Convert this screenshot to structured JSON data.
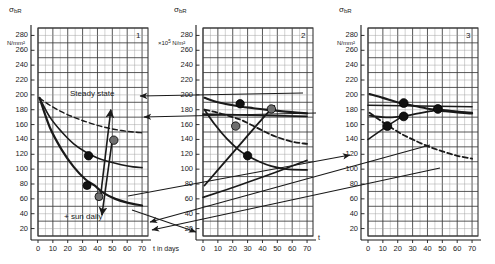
{
  "figure": {
    "background": "#ffffff",
    "ink_color": "#1a1a1a",
    "marker_dark": "#111111",
    "marker_grey": "#6e6e6e",
    "grid_major_color": "#3a3a3a",
    "grid_minor_color": "#9a9a9a"
  },
  "axes": {
    "y_label": "σ",
    "y_label_sub": "bR",
    "y_units_plain": "N/mm²",
    "y_units_scaled_prefix": "×10",
    "y_units_scaled_exp": "5",
    "y_units_scaled_suffix": " N/m²",
    "y_ticks": [
      "280",
      "260",
      "240",
      "220",
      "200",
      "180",
      "160",
      "140",
      "120",
      "100",
      "80",
      "60",
      "40",
      "20"
    ],
    "x_ticks": [
      "0",
      "10",
      "20",
      "30",
      "40",
      "50",
      "60",
      "70"
    ],
    "x_title_full": "t in days",
    "x_title_short": "t",
    "y_min": 10,
    "y_max": 290,
    "x_min": 0,
    "x_max": 74,
    "grid_minor_per_major_x": 2,
    "grid_minor_per_major_y": 2
  },
  "annotations": {
    "steady_state": "Steady state",
    "sun_daily": "+ sun daily"
  },
  "chart_data": {
    "type": "line",
    "xlabel": "t in days",
    "ylabel": "σbR in N/mm²",
    "xlim": [
      0,
      74
    ],
    "ylim": [
      10,
      290
    ],
    "grid": true,
    "legend": "none",
    "panels": [
      {
        "id": "1",
        "label": "1",
        "y_units": "N/mm²",
        "annotations": [
          "Steady state",
          "+ sun daily"
        ],
        "series": [
          {
            "name": "upper-dashed-decay",
            "style": "dashed",
            "width": 1.4,
            "points": [
              [
                1,
                196
              ],
              [
                8,
                186
              ],
              [
                16,
                177
              ],
              [
                24,
                170
              ],
              [
                32,
                164
              ],
              [
                40,
                159
              ],
              [
                48,
                155
              ],
              [
                56,
                152
              ],
              [
                64,
                150
              ],
              [
                70,
                149
              ]
            ]
          },
          {
            "name": "middle-solid-decay",
            "style": "solid",
            "width": 1.6,
            "points": [
              [
                1,
                196
              ],
              [
                8,
                170
              ],
              [
                16,
                150
              ],
              [
                24,
                134
              ],
              [
                32,
                123
              ],
              [
                40,
                115
              ],
              [
                48,
                110
              ],
              [
                56,
                106
              ],
              [
                64,
                103
              ],
              [
                70,
                102
              ]
            ]
          },
          {
            "name": "lower-solid-decay",
            "style": "solid",
            "width": 2.2,
            "points": [
              [
                1,
                196
              ],
              [
                8,
                156
              ],
              [
                16,
                126
              ],
              [
                24,
                103
              ],
              [
                32,
                86
              ],
              [
                38,
                78
              ],
              [
                44,
                68
              ],
              [
                52,
                60
              ],
              [
                60,
                55
              ],
              [
                70,
                51
              ]
            ]
          },
          {
            "name": "iteration-arrow-up",
            "style": "arrow",
            "width": 1.6,
            "points": [
              [
                42,
                62
              ],
              [
                49,
                180
              ]
            ]
          },
          {
            "name": "iteration-arrow-down",
            "style": "arrow",
            "width": 1.6,
            "points": [
              [
                50,
                140
              ],
              [
                43,
                38
              ]
            ]
          }
        ],
        "markers": [
          {
            "x": 34,
            "y": 118,
            "fill": "dark",
            "r": 4.2
          },
          {
            "x": 33,
            "y": 78,
            "fill": "dark",
            "r": 4.0
          },
          {
            "x": 41,
            "y": 63,
            "fill": "grey",
            "r": 4.0
          },
          {
            "x": 51,
            "y": 139,
            "fill": "grey",
            "r": 4.2
          }
        ]
      },
      {
        "id": "2",
        "label": "2",
        "y_units": "×10⁵ N/m²",
        "annotations": [],
        "series": [
          {
            "name": "top-decay-band",
            "style": "solid",
            "width": 2.2,
            "points": [
              [
                1,
                196
              ],
              [
                10,
                190
              ],
              [
                20,
                186
              ],
              [
                26,
                184
              ],
              [
                34,
                182
              ],
              [
                42,
                180
              ],
              [
                48,
                179
              ],
              [
                58,
                177
              ],
              [
                70,
                175
              ]
            ]
          },
          {
            "name": "upper-dashed-slow",
            "style": "dashed",
            "width": 1.8,
            "points": [
              [
                1,
                180
              ],
              [
                10,
                176
              ],
              [
                20,
                170
              ],
              [
                26,
                166
              ],
              [
                34,
                158
              ],
              [
                42,
                150
              ],
              [
                50,
                143
              ],
              [
                60,
                137
              ],
              [
                70,
                134
              ]
            ]
          },
          {
            "name": "mid-solid-decay",
            "style": "solid",
            "width": 1.8,
            "points": [
              [
                1,
                180
              ],
              [
                8,
                160
              ],
              [
                16,
                141
              ],
              [
                24,
                126
              ],
              [
                30,
                118
              ],
              [
                38,
                110
              ],
              [
                46,
                104
              ],
              [
                56,
                100
              ],
              [
                70,
                99
              ]
            ]
          },
          {
            "name": "rising-diagonal",
            "style": "solid",
            "width": 1.8,
            "points": [
              [
                1,
                78
              ],
              [
                20,
                122
              ],
              [
                30,
                145
              ],
              [
                40,
                168
              ],
              [
                48,
                185
              ]
            ]
          },
          {
            "name": "shallow-rise",
            "style": "solid",
            "width": 1.6,
            "points": [
              [
                0,
                62
              ],
              [
                24,
                78
              ],
              [
                48,
                95
              ],
              [
                70,
                112
              ]
            ]
          },
          {
            "name": "flat-transfer-line",
            "style": "solid",
            "width": 1.6,
            "points": [
              [
                0,
                174
              ],
              [
                70,
                171
              ]
            ]
          }
        ],
        "markers": [
          {
            "x": 25,
            "y": 188,
            "fill": "dark",
            "r": 4.2
          },
          {
            "x": 46,
            "y": 181,
            "fill": "grey",
            "r": 4.2
          },
          {
            "x": 22,
            "y": 158,
            "fill": "grey",
            "r": 4.2
          },
          {
            "x": 30,
            "y": 118,
            "fill": "dark",
            "r": 4.2
          }
        ]
      },
      {
        "id": "3",
        "label": "3",
        "y_units": "N/mm²",
        "annotations": [],
        "series": [
          {
            "name": "upper-descend",
            "style": "solid",
            "width": 2.2,
            "points": [
              [
                1,
                201
              ],
              [
                10,
                196
              ],
              [
                18,
                191
              ],
              [
                24,
                188
              ],
              [
                34,
                184
              ],
              [
                44,
                180
              ],
              [
                52,
                178
              ],
              [
                62,
                176
              ],
              [
                70,
                175
              ]
            ]
          },
          {
            "name": "lower-ascend",
            "style": "solid",
            "width": 1.8,
            "points": [
              [
                1,
                172
              ],
              [
                10,
                170
              ],
              [
                18,
                170
              ],
              [
                26,
                172
              ],
              [
                34,
                175
              ],
              [
                42,
                178
              ],
              [
                48,
                180
              ],
              [
                58,
                178
              ],
              [
                70,
                176
              ]
            ]
          },
          {
            "name": "dashed-decay",
            "style": "dashed",
            "width": 1.8,
            "points": [
              [
                1,
                176
              ],
              [
                8,
                166
              ],
              [
                14,
                158
              ],
              [
                22,
                148
              ],
              [
                30,
                140
              ],
              [
                40,
                131
              ],
              [
                50,
                124
              ],
              [
                60,
                118
              ],
              [
                70,
                114
              ]
            ]
          },
          {
            "name": "incoming-diagonal",
            "style": "solid",
            "width": 1.6,
            "points": [
              [
                0,
                140
              ],
              [
                13,
                158
              ],
              [
                24,
                172
              ]
            ]
          },
          {
            "name": "flat-transfer-line",
            "style": "solid",
            "width": 1.6,
            "points": [
              [
                0,
                186
              ],
              [
                70,
                184
              ]
            ]
          }
        ],
        "markers": [
          {
            "x": 24,
            "y": 189,
            "fill": "dark",
            "r": 4.4
          },
          {
            "x": 47,
            "y": 181,
            "fill": "dark",
            "r": 4.4
          },
          {
            "x": 24,
            "y": 171,
            "fill": "dark",
            "r": 4.4
          },
          {
            "x": 13,
            "y": 158,
            "fill": "dark",
            "r": 4.4
          }
        ]
      }
    ],
    "cross_panel_arrows": [
      {
        "name": "p2-to-p1-upper",
        "from": [
          303,
          93
        ],
        "to": [
          140,
          96
        ]
      },
      {
        "name": "p2-to-p1-lower",
        "from": [
          316,
          113
        ],
        "to": [
          144,
          117
        ]
      },
      {
        "name": "p1-to-p2-bottom",
        "from": [
          132,
          210
        ],
        "to": [
          196,
          232
        ]
      },
      {
        "name": "p3-to-p1-a",
        "from": [
          430,
          145
        ],
        "to": [
          150,
          222
        ]
      },
      {
        "name": "p3-to-p1-b",
        "from": [
          440,
          168
        ],
        "to": [
          152,
          230
        ]
      },
      {
        "name": "p1-to-p3",
        "from": [
          128,
          196
        ],
        "to": [
          350,
          155
        ]
      }
    ]
  }
}
